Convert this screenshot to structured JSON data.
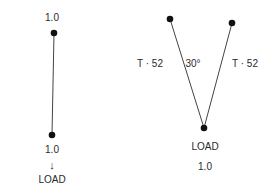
{
  "left_diagram": {
    "top_label": "1.0",
    "bottom_label": "1.0",
    "arrow": "↓",
    "load_label": "LOAD"
  },
  "right_diagram": {
    "left_tension_label": "T · 52",
    "angle_label": "30°",
    "right_tension_label": "T · 52",
    "load_label": "LOAD",
    "load_value": "1.0"
  }
}
